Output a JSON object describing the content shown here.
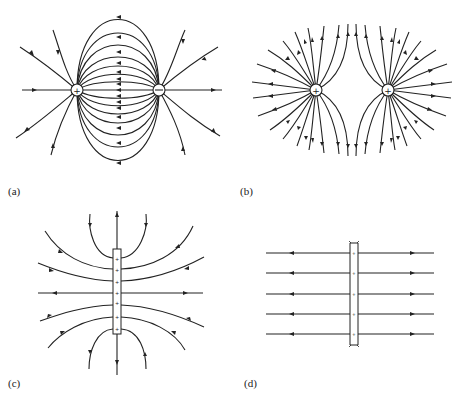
{
  "figure": {
    "panels": [
      {
        "id": "a",
        "label": "(a)",
        "description": "Electric field lines of an electric dipole (positive and negative charge)",
        "charges": [
          {
            "sign": "+",
            "symbol": "+"
          },
          {
            "sign": "-",
            "symbol": "−"
          }
        ]
      },
      {
        "id": "b",
        "label": "(b)",
        "description": "Electric field lines of two equal positive charges",
        "charges": [
          {
            "sign": "+",
            "symbol": "+"
          },
          {
            "sign": "+",
            "symbol": "+"
          }
        ]
      },
      {
        "id": "c",
        "label": "(c)",
        "description": "Field lines of a short positively charged plate (finite sheet)",
        "plate_charges": [
          "+",
          "+",
          "+",
          "+",
          "+",
          "+",
          "+"
        ]
      },
      {
        "id": "d",
        "label": "(d)",
        "description": "Uniform field lines from a large positively charged plate",
        "plate_charges": [
          "+",
          "+",
          "+",
          "+",
          "+"
        ]
      }
    ]
  }
}
